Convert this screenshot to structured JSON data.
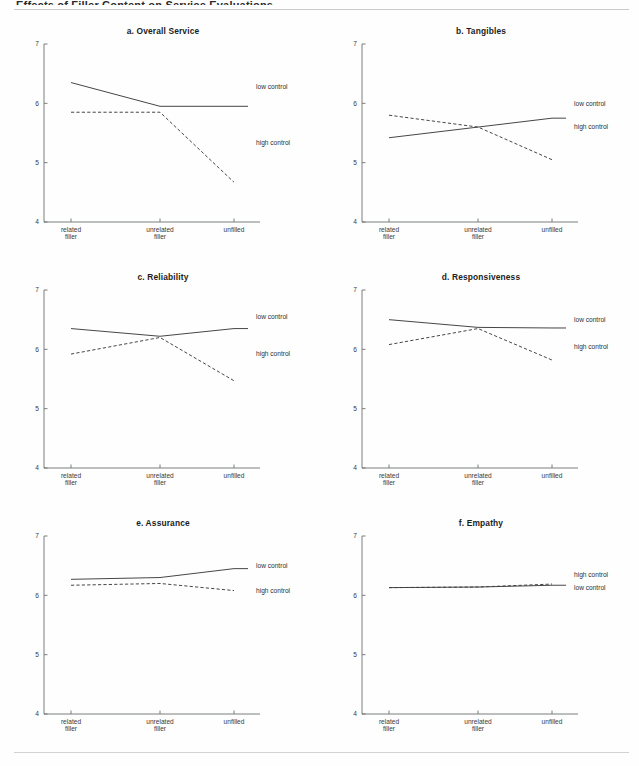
{
  "header": {
    "running_text": "Effects of Filler Content on Service Evaluations"
  },
  "axis": {
    "y_ticks": [
      "7",
      "6",
      "5",
      "4"
    ],
    "y_values": [
      7,
      6,
      5,
      4
    ],
    "x_labels": [
      {
        "line1": "related",
        "line2": "filler"
      },
      {
        "line1": "unrelated",
        "line2": "filler"
      },
      {
        "line1": "unfilled",
        "line2": ""
      }
    ]
  },
  "series_names": {
    "low": "low control",
    "high": "high control"
  },
  "chart_data": [
    {
      "type": "line",
      "title": "a. Overall Service",
      "categories": [
        "related filler",
        "unrelated filler",
        "unfilled"
      ],
      "series": [
        {
          "name": "low control",
          "style": "solid",
          "values": [
            6.35,
            5.95,
            5.95
          ],
          "label_y": 6.28
        },
        {
          "name": "high control",
          "style": "dashed",
          "values": [
            5.85,
            5.85,
            4.67
          ],
          "label_y": 5.33
        }
      ],
      "xlabel": "",
      "ylabel": "",
      "ylim": [
        4,
        7
      ],
      "grid": false,
      "legend": "right-inline"
    },
    {
      "type": "line",
      "title": "b. Tangibles",
      "categories": [
        "related filler",
        "unrelated filler",
        "unfilled"
      ],
      "series": [
        {
          "name": "low control",
          "style": "solid",
          "values": [
            5.42,
            5.6,
            5.75
          ],
          "label_y": 6.0
        },
        {
          "name": "high control",
          "style": "dashed",
          "values": [
            5.8,
            5.6,
            5.05
          ],
          "label_y": 5.6
        }
      ],
      "xlabel": "",
      "ylabel": "",
      "ylim": [
        4,
        7
      ],
      "grid": false,
      "legend": "right-inline"
    },
    {
      "type": "line",
      "title": "c. Reliability",
      "categories": [
        "related filler",
        "unrelated filler",
        "unfilled"
      ],
      "series": [
        {
          "name": "low control",
          "style": "solid",
          "values": [
            6.35,
            6.22,
            6.35
          ],
          "label_y": 6.55
        },
        {
          "name": "high control",
          "style": "dashed",
          "values": [
            5.92,
            6.2,
            5.47
          ],
          "label_y": 5.93
        }
      ],
      "xlabel": "",
      "ylabel": "",
      "ylim": [
        4,
        7
      ],
      "grid": false,
      "legend": "right-inline"
    },
    {
      "type": "line",
      "title": "d. Responsiveness",
      "categories": [
        "related filler",
        "unrelated filler",
        "unfilled"
      ],
      "series": [
        {
          "name": "low control",
          "style": "solid",
          "values": [
            6.5,
            6.37,
            6.36
          ],
          "label_y": 6.5
        },
        {
          "name": "high control",
          "style": "dashed",
          "values": [
            6.08,
            6.35,
            5.82
          ],
          "label_y": 6.05
        }
      ],
      "xlabel": "",
      "ylabel": "",
      "ylim": [
        4,
        7
      ],
      "grid": false,
      "legend": "right-inline"
    },
    {
      "type": "line",
      "title": "e. Assurance",
      "categories": [
        "related filler",
        "unrelated filler",
        "unfilled"
      ],
      "series": [
        {
          "name": "low control",
          "style": "solid",
          "values": [
            6.27,
            6.3,
            6.45
          ],
          "label_y": 6.5
        },
        {
          "name": "high control",
          "style": "dashed",
          "values": [
            6.17,
            6.2,
            6.08
          ],
          "label_y": 6.08
        }
      ],
      "xlabel": "",
      "ylabel": "",
      "ylim": [
        4,
        7
      ],
      "grid": false,
      "legend": "right-inline"
    },
    {
      "type": "line",
      "title": "f. Empathy",
      "categories": [
        "related filler",
        "unrelated filler",
        "unfilled"
      ],
      "series": [
        {
          "name": "high control",
          "style": "dashed",
          "values": [
            6.13,
            6.14,
            6.19
          ],
          "label_y": 6.35
        },
        {
          "name": "low control",
          "style": "solid",
          "values": [
            6.13,
            6.14,
            6.17
          ],
          "label_y": 6.13
        }
      ],
      "xlabel": "",
      "ylabel": "",
      "ylim": [
        4,
        7
      ],
      "grid": false,
      "legend": "right-inline"
    }
  ],
  "colors": {
    "line": "#3c3c3c",
    "axis": "#6d6f70",
    "text": "#2b2b2b",
    "rule": "#c9cbcc",
    "background": "#fefefe"
  }
}
